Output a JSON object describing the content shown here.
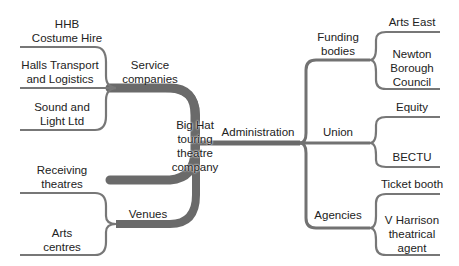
{
  "diagram": {
    "type": "mind-map",
    "colors": {
      "line": "#6e6e6e",
      "trunk": "#5a5a5a",
      "text": "#222222",
      "background": "#ffffff"
    },
    "center": {
      "label_lines": [
        "Big Hat",
        "touring",
        "theatre",
        "company"
      ]
    },
    "branches": {
      "service": {
        "label_lines": [
          "Service",
          "companies"
        ],
        "leaves": [
          {
            "label_lines": [
              "HHB",
              "Costume Hire"
            ]
          },
          {
            "label_lines": [
              "Halls Transport",
              "and Logistics"
            ]
          },
          {
            "label_lines": [
              "Sound and",
              "Light Ltd"
            ]
          }
        ]
      },
      "venues": {
        "label_lines": [
          "Venues"
        ],
        "leaves": [
          {
            "label_lines": [
              "Receiving",
              "theatres"
            ]
          },
          {
            "label_lines": [
              "Arts",
              "centres"
            ]
          }
        ]
      },
      "administration": {
        "label_lines": [
          "Administration"
        ],
        "sub": {
          "funding": {
            "label_lines": [
              "Funding",
              "bodies"
            ],
            "leaves": [
              {
                "label_lines": [
                  "Arts East"
                ]
              },
              {
                "label_lines": [
                  "Newton",
                  "Borough",
                  "Council"
                ]
              }
            ]
          },
          "union": {
            "label_lines": [
              "Union"
            ],
            "leaves": [
              {
                "label_lines": [
                  "Equity"
                ]
              },
              {
                "label_lines": [
                  "BECTU"
                ]
              }
            ]
          },
          "agencies": {
            "label_lines": [
              "Agencies"
            ],
            "leaves": [
              {
                "label_lines": [
                  "Ticket booth"
                ]
              },
              {
                "label_lines": [
                  "V Harrison",
                  "theatrical",
                  "agent"
                ]
              }
            ]
          }
        }
      }
    }
  }
}
